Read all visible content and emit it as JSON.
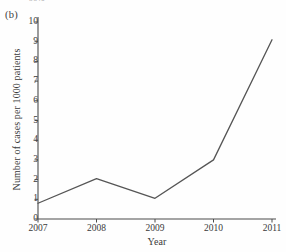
{
  "figure": {
    "panel_label": "(b)",
    "clipped_text_above": "= 99%"
  },
  "chart_data": {
    "type": "line",
    "title": "",
    "xlabel": "Year",
    "ylabel": "Number of cases per 1000 patients",
    "categories": [
      "2007",
      "2008",
      "2009",
      "2010",
      "2011"
    ],
    "x": [
      2007,
      2008,
      2009,
      2010,
      2011
    ],
    "values": [
      0.8,
      2.05,
      1.05,
      3.0,
      9.1
    ],
    "series": [
      {
        "name": "Number of cases per 1000 patients",
        "values": [
          0.8,
          2.05,
          1.05,
          3.0,
          9.1
        ]
      }
    ],
    "ylim": [
      0,
      10
    ],
    "xlim": [
      2007,
      2011
    ],
    "yticks": [
      0,
      1,
      2,
      3,
      4,
      5,
      6,
      7,
      8,
      9,
      10
    ],
    "ytick_labels": [
      "0",
      "1",
      "2",
      "3",
      "4",
      "5",
      "6",
      "7",
      "8",
      "9",
      "10"
    ],
    "xticks": [
      2007,
      2008,
      2009,
      2010,
      2011
    ],
    "xtick_labels": [
      "2007",
      "2008",
      "2009",
      "2010",
      "2011"
    ],
    "grid": false,
    "legend": "none",
    "line_color": "#555555",
    "axis_color": "#4a4a4a",
    "markers": false,
    "tick_direction": "out"
  }
}
